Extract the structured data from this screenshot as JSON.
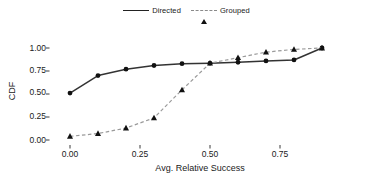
{
  "chart_data": {
    "type": "line",
    "title": "",
    "xlabel": "Avg. Relative Success",
    "ylabel": "CDF",
    "xlim": [
      -0.03,
      0.96
    ],
    "ylim": [
      -0.03,
      1.04
    ],
    "xticks": [
      "0.00",
      "0.25",
      "0.50",
      "0.75"
    ],
    "xtick_values": [
      0.0,
      0.25,
      0.5,
      0.75
    ],
    "yticks": [
      "0.00",
      "0.25",
      "0.50",
      "0.75",
      "1.00"
    ],
    "ytick_values": [
      0.0,
      0.25,
      0.5,
      0.75,
      1.0
    ],
    "grid": false,
    "legend_position": "top-center",
    "x": [
      0.0,
      0.1,
      0.2,
      0.3,
      0.4,
      0.5,
      0.6,
      0.7,
      0.8,
      0.9
    ],
    "series": [
      {
        "name": "Directed",
        "marker": "circle",
        "linestyle": "solid",
        "color": "#333333",
        "values": [
          0.51,
          0.7,
          0.77,
          0.81,
          0.83,
          0.835,
          0.845,
          0.86,
          0.87,
          1.0
        ]
      },
      {
        "name": "Grouped",
        "marker": "triangle",
        "linestyle": "dashed",
        "color": "#9a9a9a",
        "values": [
          0.04,
          0.07,
          0.13,
          0.24,
          0.545,
          0.835,
          0.895,
          0.955,
          0.985,
          1.0
        ]
      }
    ]
  },
  "legend": {
    "entries": [
      {
        "label": "Directed"
      },
      {
        "label": "Grouped"
      }
    ]
  },
  "axes": {
    "y_label": "CDF",
    "x_label": "Avg. Relative Success",
    "y_tick_labels": [
      "1.00",
      "0.75",
      "0.50",
      "0.25",
      "0.00"
    ],
    "x_tick_labels": [
      "0.00",
      "0.25",
      "0.50",
      "0.75"
    ]
  },
  "style": {
    "background": "#ffffff",
    "directed_color": "#333333",
    "grouped_color": "#9a9a9a",
    "marker_color": "#111111",
    "text_color": "#1a1a1a"
  }
}
